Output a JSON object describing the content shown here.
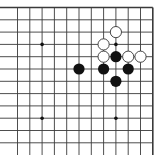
{
  "board": {
    "type": "go-diagram",
    "view": "top-right corner fragment",
    "colors": {
      "background": "#ffffff",
      "line": "#3a3a3a",
      "black_stone": "#111111",
      "white_stone_fill": "#ffffff",
      "white_stone_stroke": "#333333",
      "star_point": "#111111"
    },
    "grid": {
      "x0": 17.5,
      "y0": 7.5,
      "spacing": 12.3,
      "cols": 12,
      "rows": 13,
      "top_border": true,
      "right_border": true,
      "left_open": true,
      "bottom_open": true
    },
    "star_points": [
      {
        "col": 2,
        "row": 3
      },
      {
        "col": 8,
        "row": 3
      },
      {
        "col": 2,
        "row": 9
      },
      {
        "col": 8,
        "row": 9
      }
    ],
    "stones": [
      {
        "color": "white",
        "col": 8,
        "row": 2
      },
      {
        "color": "white",
        "col": 7,
        "row": 3
      },
      {
        "color": "white",
        "col": 7,
        "row": 4
      },
      {
        "color": "black",
        "col": 8,
        "row": 4
      },
      {
        "color": "white",
        "col": 9,
        "row": 4
      },
      {
        "color": "white",
        "col": 10,
        "row": 4
      },
      {
        "color": "black",
        "col": 5,
        "row": 5
      },
      {
        "color": "black",
        "col": 7,
        "row": 5
      },
      {
        "color": "black",
        "col": 9,
        "row": 5
      },
      {
        "color": "black",
        "col": 8,
        "row": 6
      }
    ]
  }
}
